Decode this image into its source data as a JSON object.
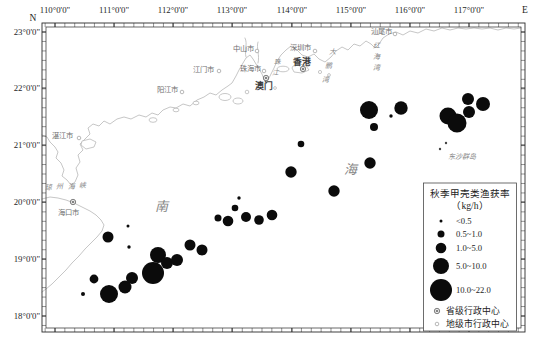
{
  "figure": {
    "type": "proportional-symbol-map",
    "compass": {
      "north": "N",
      "east": "E"
    },
    "colors": {
      "station": "#0b0b0b",
      "coastline": "#b7b7b7",
      "sea_text": "#868686",
      "axis_text": "#1f1f1f",
      "frame": "#2a2a2a"
    }
  },
  "axes": {
    "x_ticks": [
      {
        "label": "110°0'0\"",
        "x": 55
      },
      {
        "label": "111°0'0\"",
        "x": 114
      },
      {
        "label": "112°0'0\"",
        "x": 173
      },
      {
        "label": "113°0'0\"",
        "x": 232
      },
      {
        "label": "114°0'0\"",
        "x": 292
      },
      {
        "label": "115°0'0\"",
        "x": 351
      },
      {
        "label": "116°0'0\"",
        "x": 410
      },
      {
        "label": "117°0'0\"",
        "x": 469
      }
    ],
    "y_ticks": [
      {
        "label": "23°0'0\"",
        "y": 32
      },
      {
        "label": "22°0'0\"",
        "y": 88
      },
      {
        "label": "21°0'0\"",
        "y": 145
      },
      {
        "label": "20°0'0\"",
        "y": 202
      },
      {
        "label": "19°0'0\"",
        "y": 259
      },
      {
        "label": "18°0'0\"",
        "y": 316
      }
    ],
    "minor_step_x": 9.857,
    "minor_step_y": 9.467
  },
  "cities": [
    {
      "name": "湛江市",
      "x": 62,
      "y": 135,
      "type": "prefecture",
      "marker": [
        79,
        138
      ]
    },
    {
      "name": "阳江市",
      "x": 167,
      "y": 89,
      "type": "prefecture",
      "marker": [
        182,
        92
      ]
    },
    {
      "name": "江门市",
      "x": 203,
      "y": 69,
      "type": "prefecture",
      "marker": [
        219,
        71
      ]
    },
    {
      "name": "中山市",
      "x": 243,
      "y": 48,
      "type": "prefecture",
      "marker": [
        257,
        51
      ]
    },
    {
      "name": "珠海市",
      "x": 250,
      "y": 68,
      "type": "prefecture",
      "marker": [
        264,
        71
      ]
    },
    {
      "name": "深圳市",
      "x": 300,
      "y": 47,
      "type": "prefecture",
      "marker": [
        315,
        51
      ]
    },
    {
      "name": "汕尾市",
      "x": 381,
      "y": 31,
      "type": "prefecture",
      "marker": [
        395,
        34
      ]
    },
    {
      "name": "香港",
      "x": 302,
      "y": 62,
      "type": "province",
      "marker": [
        303,
        69
      ],
      "major": true
    },
    {
      "name": "澳门",
      "x": 264,
      "y": 86,
      "type": "province",
      "marker": [
        266,
        78
      ],
      "major": true
    },
    {
      "name": "海口市",
      "x": 68,
      "y": 212,
      "type": "province",
      "marker": [
        73,
        202
      ]
    }
  ],
  "sea_labels": [
    {
      "text": "琼州海峡",
      "x": 45,
      "y": 190,
      "size": 7,
      "spacing": 4.5,
      "rotate": -3
    },
    {
      "text": "南",
      "x": 155,
      "y": 211,
      "size": 13
    },
    {
      "text": "海",
      "x": 344,
      "y": 174,
      "size": 13
    },
    {
      "text": "珠江",
      "x": 277,
      "y": 64,
      "size": 6.5,
      "vertical": true,
      "lineh": 11,
      "dx": -2
    },
    {
      "text": "大鹏湾",
      "x": 332,
      "y": 54,
      "size": 7,
      "vertical": true,
      "lineh": 14,
      "dx": -3.5
    },
    {
      "text": "红海湾",
      "x": 376,
      "y": 48,
      "size": 7,
      "vertical": true,
      "lineh": 11,
      "dx": 0
    },
    {
      "text": "东沙群岛",
      "x": 448,
      "y": 159,
      "size": 7
    }
  ],
  "island_dots": [
    [
      440,
      149
    ],
    [
      446,
      143
    ]
  ],
  "chart_data": {
    "type": "scatter",
    "stations": [
      {
        "x": 128,
        "y": 226,
        "r": 1.5,
        "class": "<0.5"
      },
      {
        "x": 108,
        "y": 237,
        "r": 5.5,
        "class": "1.0~5.0"
      },
      {
        "x": 129,
        "y": 247,
        "r": 1.7,
        "class": "<0.5"
      },
      {
        "x": 94,
        "y": 279,
        "r": 4.4,
        "class": "1.0~5.0"
      },
      {
        "x": 83,
        "y": 294,
        "r": 2.0,
        "class": "<0.5"
      },
      {
        "x": 109,
        "y": 294,
        "r": 9.0,
        "class": "5.0~10.0"
      },
      {
        "x": 125,
        "y": 287,
        "r": 6.5,
        "class": "1.0~5.0"
      },
      {
        "x": 132,
        "y": 278,
        "r": 6.0,
        "class": "1.0~5.0"
      },
      {
        "x": 153,
        "y": 273,
        "r": 11.0,
        "class": "10.0~22.0"
      },
      {
        "x": 158,
        "y": 255,
        "r": 8.0,
        "class": "5.0~10.0"
      },
      {
        "x": 167,
        "y": 263,
        "r": 6.0,
        "class": "1.0~5.0"
      },
      {
        "x": 177,
        "y": 260,
        "r": 6.0,
        "class": "1.0~5.0"
      },
      {
        "x": 190,
        "y": 245,
        "r": 5.5,
        "class": "1.0~5.0"
      },
      {
        "x": 202,
        "y": 250,
        "r": 5.5,
        "class": "1.0~5.0"
      },
      {
        "x": 218,
        "y": 218,
        "r": 3.5,
        "class": "0.5~1.0"
      },
      {
        "x": 228,
        "y": 221,
        "r": 5.3,
        "class": "1.0~5.0"
      },
      {
        "x": 239,
        "y": 198,
        "r": 1.7,
        "class": "<0.5"
      },
      {
        "x": 235,
        "y": 208,
        "r": 3.3,
        "class": "0.5~1.0"
      },
      {
        "x": 246,
        "y": 217,
        "r": 5.0,
        "class": "1.0~5.0"
      },
      {
        "x": 259,
        "y": 220,
        "r": 4.8,
        "class": "1.0~5.0"
      },
      {
        "x": 272,
        "y": 215,
        "r": 5.3,
        "class": "1.0~5.0"
      },
      {
        "x": 291,
        "y": 172,
        "r": 5.7,
        "class": "1.0~5.0"
      },
      {
        "x": 301,
        "y": 144,
        "r": 3.3,
        "class": "0.5~1.0"
      },
      {
        "x": 334,
        "y": 191,
        "r": 5.7,
        "class": "1.0~5.0"
      },
      {
        "x": 370,
        "y": 163,
        "r": 5.7,
        "class": "1.0~5.0"
      },
      {
        "x": 369,
        "y": 110,
        "r": 9.0,
        "class": "5.0~10.0"
      },
      {
        "x": 401,
        "y": 108,
        "r": 6.7,
        "class": "5.0~10.0"
      },
      {
        "x": 391,
        "y": 116,
        "r": 1.7,
        "class": "<0.5"
      },
      {
        "x": 374,
        "y": 127,
        "r": 4.0,
        "class": "0.5~1.0"
      },
      {
        "x": 468,
        "y": 99,
        "r": 6.0,
        "class": "1.0~5.0"
      },
      {
        "x": 483,
        "y": 104,
        "r": 7.0,
        "class": "5.0~10.0"
      },
      {
        "x": 469,
        "y": 112,
        "r": 6.0,
        "class": "1.0~5.0"
      },
      {
        "x": 448,
        "y": 116,
        "r": 8.5,
        "class": "5.0~10.0"
      },
      {
        "x": 457,
        "y": 123,
        "r": 9.5,
        "class": "5.0~10.0"
      }
    ]
  },
  "legend": {
    "title": "秋季甲壳类渔获率",
    "unit": "（kg/h）",
    "size_items": [
      {
        "r": 1.5,
        "y": 221,
        "label": "<0.5"
      },
      {
        "r": 3.5,
        "y": 234,
        "label": "0.5~1.0"
      },
      {
        "r": 5.3,
        "y": 248,
        "label": "1.0~5.0"
      },
      {
        "r": 8.0,
        "y": 266,
        "label": "5.0~10.0"
      },
      {
        "r": 11.0,
        "y": 290,
        "label": "10.0~22.0"
      }
    ],
    "admin_items": [
      {
        "type": "province",
        "y": 311,
        "label": "省级行政中心"
      },
      {
        "type": "prefecture",
        "y": 324,
        "label": "地级市行政中心"
      }
    ]
  }
}
